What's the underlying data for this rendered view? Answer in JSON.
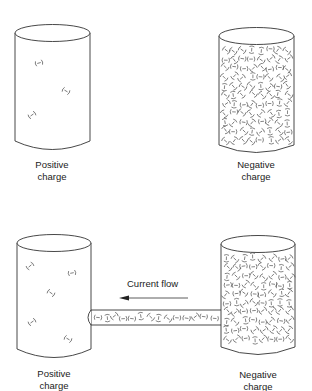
{
  "diagram": {
    "top_row": {
      "left": {
        "label_line1": "Positive",
        "label_line2": "charge",
        "charge_count": 3
      },
      "right": {
        "label_line1": "Negative",
        "label_line2": "charge",
        "charge_count": "many"
      }
    },
    "bottom_row": {
      "left": {
        "label_line1": "Positive",
        "label_line2": "charge",
        "charge_count": 5
      },
      "right": {
        "label_line1": "Negative",
        "label_line2": "charge",
        "charge_count": "many"
      },
      "conductor": {
        "label": "Current flow",
        "arrow_direction": "left"
      }
    },
    "charge_symbol": "(−)",
    "colors": {
      "stroke": "#333333",
      "charge": "#555555",
      "background": "#ffffff"
    }
  }
}
